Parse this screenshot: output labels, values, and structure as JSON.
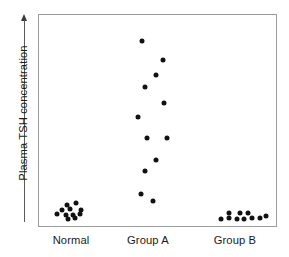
{
  "chart_data": {
    "type": "scatter",
    "title": "",
    "xlabel": "",
    "ylabel": "Plasma TSH concentration",
    "ylabel_arrow": "up-arrow",
    "grid": false,
    "legend": "none",
    "axis_frame": true,
    "y_tick_labels": [],
    "x_tick_labels": [
      "Normal",
      "Group A",
      "Group B"
    ],
    "categories": [
      "Normal",
      "Group A",
      "Group B"
    ],
    "x_category_centers_pct": [
      13.8,
      46.0,
      82.4
    ],
    "y_axis_note": "Arbitrary units; axis increases upward, no numeric ticks shown",
    "series": [
      {
        "name": "Normal",
        "n": 11,
        "points": [
          {
            "x_pct": 11.7,
            "y_pct": 90.1
          },
          {
            "x_pct": 15.5,
            "y_pct": 89.2
          },
          {
            "x_pct": 9.6,
            "y_pct": 92.5
          },
          {
            "x_pct": 13.0,
            "y_pct": 92.0
          },
          {
            "x_pct": 17.6,
            "y_pct": 92.5
          },
          {
            "x_pct": 7.5,
            "y_pct": 94.4
          },
          {
            "x_pct": 11.3,
            "y_pct": 94.8
          },
          {
            "x_pct": 14.2,
            "y_pct": 94.8
          },
          {
            "x_pct": 17.2,
            "y_pct": 94.4
          },
          {
            "x_pct": 12.1,
            "y_pct": 96.7
          },
          {
            "x_pct": 15.1,
            "y_pct": 96.2
          }
        ]
      },
      {
        "name": "Group A",
        "n": 13,
        "points": [
          {
            "x_pct": 43.5,
            "y_pct": 12.2
          },
          {
            "x_pct": 52.3,
            "y_pct": 21.1
          },
          {
            "x_pct": 49.4,
            "y_pct": 28.6
          },
          {
            "x_pct": 44.8,
            "y_pct": 34.3
          },
          {
            "x_pct": 52.7,
            "y_pct": 41.8
          },
          {
            "x_pct": 41.8,
            "y_pct": 48.4
          },
          {
            "x_pct": 45.6,
            "y_pct": 58.2
          },
          {
            "x_pct": 54.0,
            "y_pct": 58.2
          },
          {
            "x_pct": 49.4,
            "y_pct": 68.5
          },
          {
            "x_pct": 44.8,
            "y_pct": 73.7
          },
          {
            "x_pct": 43.1,
            "y_pct": 85.0
          },
          {
            "x_pct": 48.1,
            "y_pct": 88.3
          }
        ]
      },
      {
        "name": "Group B",
        "n": 10,
        "points": [
          {
            "x_pct": 80.3,
            "y_pct": 93.9
          },
          {
            "x_pct": 88.3,
            "y_pct": 93.9
          },
          {
            "x_pct": 76.6,
            "y_pct": 96.7
          },
          {
            "x_pct": 80.3,
            "y_pct": 96.2
          },
          {
            "x_pct": 83.7,
            "y_pct": 96.7
          },
          {
            "x_pct": 86.6,
            "y_pct": 96.7
          },
          {
            "x_pct": 90.0,
            "y_pct": 96.2
          },
          {
            "x_pct": 93.3,
            "y_pct": 96.2
          },
          {
            "x_pct": 95.8,
            "y_pct": 95.3
          },
          {
            "x_pct": 84.9,
            "y_pct": 93.9
          }
        ]
      }
    ]
  },
  "style": {
    "point_color": "#111111",
    "frame_color": "#9a9a9a",
    "axis_color": "#5a5a5a",
    "text_color": "#1a1a1a",
    "background": "#ffffff"
  }
}
